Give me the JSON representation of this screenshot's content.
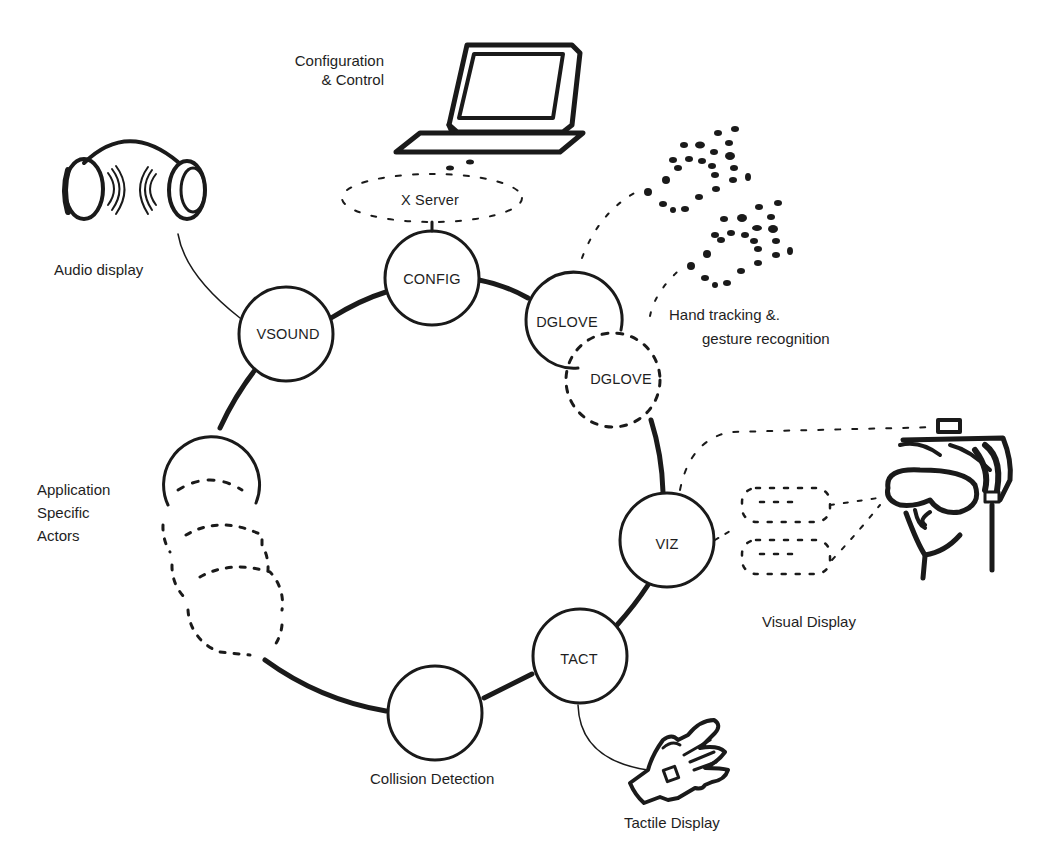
{
  "diagram": {
    "type": "actor-ring architecture",
    "nodes": [
      {
        "id": "config",
        "label": "CONFIG",
        "style": "solid"
      },
      {
        "id": "dglove1",
        "label": "DGLOVE",
        "style": "solid"
      },
      {
        "id": "dglove2",
        "label": "DGLOVE",
        "style": "dashed"
      },
      {
        "id": "viz",
        "label": "VIZ",
        "style": "solid"
      },
      {
        "id": "tact",
        "label": "TACT",
        "style": "solid"
      },
      {
        "id": "collision",
        "label": "",
        "style": "solid"
      },
      {
        "id": "app_actors",
        "label": "",
        "style": "stacked-dashed"
      },
      {
        "id": "vsound",
        "label": "VSOUND",
        "style": "solid"
      }
    ],
    "server": {
      "label": "X Server"
    },
    "captions": {
      "config": [
        "Configuration",
        "& Control"
      ],
      "audio": "Audio display",
      "hand": [
        "Hand tracking &.",
        "gesture recognition"
      ],
      "app": [
        "Application",
        "Specific",
        "Actors"
      ],
      "visual": "Visual Display",
      "collision": "Collision Detection",
      "tactile": "Tactile Display"
    },
    "devices": [
      {
        "name": "workstation",
        "connects_to": "X Server"
      },
      {
        "name": "headphones",
        "connects_to": "VSOUND"
      },
      {
        "name": "data-gloves",
        "connects_to": "DGLOVE"
      },
      {
        "name": "head-mounted-display",
        "connects_to": "VIZ"
      },
      {
        "name": "tactile-glove",
        "connects_to": "TACT"
      }
    ],
    "colors": {
      "ink": "#1a1a1a",
      "background": "#ffffff"
    }
  }
}
